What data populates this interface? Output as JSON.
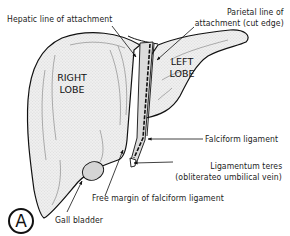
{
  "figure": {
    "panel_label": "A",
    "top_cut_text": "",
    "lobes": {
      "right": [
        "RIGHT",
        "LOBE"
      ],
      "left": [
        "LEFT",
        "LOBE"
      ]
    },
    "labels": {
      "hepatic_line": "Hepatic line of attachment",
      "parietal_line_1": "Parietal line of",
      "parietal_line_2": "attachment (cut edge)",
      "falciform": "Falciform ligament",
      "teres_1": "Ligamentum teres",
      "teres_2": "(obliterateo umbilical vein)",
      "free_margin": "Free margin of falciform ligament",
      "gall_bladder": "Gall bladder"
    },
    "colors": {
      "ink": "#111111",
      "fill": "#e9e9e9",
      "background": "#ffffff"
    }
  }
}
